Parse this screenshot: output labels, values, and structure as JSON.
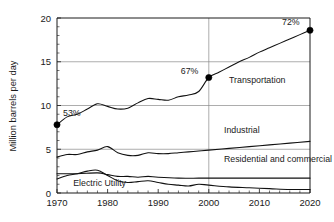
{
  "chart_data": {
    "type": "line",
    "title": "",
    "xlabel": "",
    "ylabel": "Million barrels per day",
    "xlim": [
      1970,
      2020
    ],
    "ylim": [
      0,
      20
    ],
    "grid": true,
    "legend": "inline-labels",
    "xticks": [
      "1970",
      "1980",
      "1990",
      "2000",
      "2010",
      "2020"
    ],
    "xtick_values": [
      1970,
      1980,
      1990,
      2000,
      2010,
      2020
    ],
    "yticks": [
      "0",
      "5",
      "10",
      "15",
      "20"
    ],
    "ytick_values": [
      0,
      5,
      10,
      15,
      20
    ],
    "gridlines_y": [
      5,
      10,
      15,
      20
    ],
    "gridlines_x": [
      2000
    ],
    "series": [
      {
        "name": "Transportation",
        "label": "Transportation",
        "label_x": 2004,
        "label_y": 12.6,
        "x": [
          1970,
          1972,
          1974,
          1976,
          1978,
          1980,
          1982,
          1984,
          1986,
          1988,
          1990,
          1992,
          1994,
          1996,
          1998,
          2000,
          2002,
          2004,
          2006,
          2008,
          2010,
          2012,
          2014,
          2016,
          2018,
          2020
        ],
        "values": [
          7.8,
          8.7,
          9.0,
          9.6,
          10.2,
          9.9,
          9.6,
          9.7,
          10.3,
          10.8,
          10.7,
          10.6,
          11.0,
          11.2,
          11.6,
          13.2,
          13.8,
          14.4,
          15.0,
          15.5,
          16.1,
          16.6,
          17.1,
          17.6,
          18.1,
          18.6
        ]
      },
      {
        "name": "Industrial",
        "label": "Industrial",
        "label_x": 2003,
        "label_y": 6.9,
        "x": [
          1970,
          1972,
          1974,
          1976,
          1978,
          1980,
          1982,
          1984,
          1986,
          1988,
          1990,
          1992,
          1994,
          1996,
          1998,
          2000,
          2004,
          2008,
          2012,
          2016,
          2020
        ],
        "values": [
          4.1,
          4.4,
          4.4,
          4.7,
          4.9,
          5.3,
          4.6,
          4.3,
          4.3,
          4.6,
          4.5,
          4.5,
          4.6,
          4.7,
          4.8,
          4.9,
          5.1,
          5.3,
          5.5,
          5.7,
          5.9
        ]
      },
      {
        "name": "Residential and commercial",
        "label": "Residential and commercial",
        "label_x": 2003,
        "label_y": 3.6,
        "x": [
          1970,
          1974,
          1978,
          1980,
          1982,
          1984,
          1986,
          1988,
          1990,
          1994,
          1998,
          2000,
          2004,
          2008,
          2012,
          2016,
          2020
        ],
        "values": [
          2.2,
          2.2,
          2.3,
          2.1,
          1.9,
          1.9,
          1.8,
          1.9,
          1.8,
          1.7,
          1.7,
          1.7,
          1.7,
          1.7,
          1.7,
          1.7,
          1.7
        ]
      },
      {
        "name": "Electric Utility",
        "label": "Electric Utility",
        "label_x": 1973.2,
        "label_y": 0.85,
        "x": [
          1970,
          1972,
          1974,
          1976,
          1978,
          1980,
          1982,
          1984,
          1986,
          1988,
          1990,
          1992,
          1994,
          1996,
          1998,
          2000,
          2004,
          2008,
          2012,
          2016,
          2020
        ],
        "values": [
          1.6,
          2.0,
          2.2,
          2.5,
          2.6,
          2.0,
          1.4,
          1.2,
          1.3,
          1.4,
          1.2,
          1.0,
          0.9,
          0.8,
          1.0,
          0.9,
          0.7,
          0.6,
          0.5,
          0.4,
          0.4
        ]
      }
    ],
    "annotations": [
      {
        "text": "53%",
        "x": 1970,
        "y": 7.8,
        "marker": true,
        "label_dx": 6,
        "label_dy": -9
      },
      {
        "text": "67%",
        "x": 2000,
        "y": 13.2,
        "marker": true,
        "label_dx": -28,
        "label_dy": -4
      },
      {
        "text": "72%",
        "x": 2020,
        "y": 18.6,
        "marker": true,
        "label_dx": -28,
        "label_dy": -5
      }
    ]
  },
  "colors": {
    "line": "#111111",
    "grid": "#8a8a8a",
    "axis": "#1a1a1a",
    "background": "#ffffff"
  }
}
